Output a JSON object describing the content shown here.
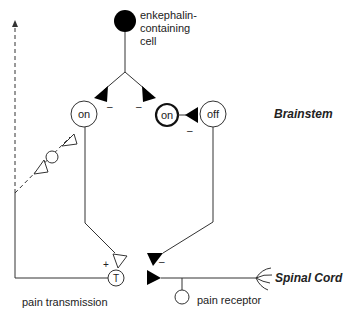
{
  "diagram": {
    "type": "neural circuit",
    "nodes": {
      "enkephalin_cell": {
        "label_lines": [
          "enkephalin-",
          "containing",
          "cell"
        ]
      },
      "on_cell_left": {
        "label": "on"
      },
      "on_cell_bold": {
        "label": "on"
      },
      "off_cell": {
        "label": "off"
      },
      "transmission_cell": {
        "label": "T"
      },
      "pain_receptor": {
        "label": "pain receptor"
      }
    },
    "labels": {
      "brainstem": "Brainstem",
      "spinal_cord": "Spinal Cord",
      "pain_transmission": "pain transmission"
    },
    "signs": {
      "inhibit_left": "–",
      "inhibit_right": "–",
      "inhibit_off": "–",
      "inhibit_spinal": "–",
      "excite_T": "+"
    },
    "colors": {
      "line": "#333333",
      "fill_dark": "#000000",
      "background": "#ffffff"
    }
  }
}
